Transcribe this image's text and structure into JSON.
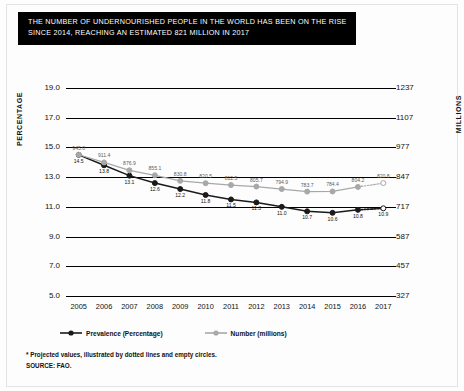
{
  "title": {
    "line1": "THE NUMBER OF UNDERNOURISHED PEOPLE IN THE WORLD HAS BEEN ON THE RISE",
    "line2": "SINCE 2014, REACHING AN ESTIMATED 821 MILLION IN 2017"
  },
  "axis_titles": {
    "left": "PERCENTAGE",
    "right": "MILLIONS"
  },
  "footnote": {
    "line1": "* Projected values, illustrated by dotted lines and empty circles.",
    "line2": "SOURCE: FAO."
  },
  "colors": {
    "prevalence": "#1a1a1a",
    "number": "#a8a8a8",
    "banner_bg": "#000000",
    "banner_text": "#ffffff",
    "grid": "#000000",
    "page_bg": "#fdfdfd"
  },
  "chart_data": {
    "type": "line",
    "title": "THE NUMBER OF UNDERNOURISHED PEOPLE IN THE WORLD HAS BEEN ON THE RISE SINCE 2014, REACHING AN ESTIMATED 821 MILLION IN 2017",
    "xlabel": "",
    "ylabel": "PERCENTAGE",
    "y2label": "MILLIONS",
    "grid": true,
    "legend_position": "bottom-left",
    "categories": [
      "2005",
      "2006",
      "2007",
      "2008",
      "2009",
      "2010",
      "2011",
      "2012",
      "2013",
      "2014",
      "2015",
      "2016",
      "2017"
    ],
    "xticklabels": [
      "2005",
      "2006",
      "2007",
      "2008",
      "2009",
      "2010",
      "2011",
      "2012",
      "2013",
      "2014",
      "2015",
      "2016",
      "2017"
    ],
    "ylim": [
      5.0,
      19.0
    ],
    "yticklabels": [
      "19.0",
      "17.0",
      "15.0",
      "13.0",
      "11.0",
      "9.0",
      "7.0",
      "5.0"
    ],
    "ytickvalues": [
      19.0,
      17.0,
      15.0,
      13.0,
      11.0,
      9.0,
      7.0,
      5.0
    ],
    "y2lim": [
      327,
      1237
    ],
    "y2ticklabels": [
      "1237",
      "1107",
      "977",
      "847",
      "717",
      "587",
      "457",
      "327"
    ],
    "y2tickvalues": [
      1237,
      1107,
      977,
      847,
      717,
      587,
      457,
      327
    ],
    "series": [
      {
        "name": "Prevalence (Percentage)",
        "axis": "left",
        "color": "#1a1a1a",
        "marker": "filled-circle",
        "values": [
          14.5,
          13.8,
          13.1,
          12.6,
          12.2,
          11.8,
          11.5,
          11.3,
          11.0,
          10.7,
          10.6,
          10.8,
          10.9
        ],
        "labels": [
          "14.5",
          "13.8",
          "13.1",
          "12.6",
          "12.2",
          "11.8",
          "11.5",
          "11.3",
          "11.0",
          "10.7",
          "10.6",
          "10.8",
          "10.9"
        ],
        "projected_from_index": 12,
        "projected_note": "2017 value is projected (dotted line, empty circle)"
      },
      {
        "name": "Number (millions)",
        "axis": "right",
        "color": "#a8a8a8",
        "marker": "filled-circle",
        "values": [
          945.0,
          911.4,
          876.9,
          855.1,
          830.8,
          820.5,
          812.5,
          805.7,
          794.9,
          783.7,
          784.4,
          804.2,
          820.8
        ],
        "labels": [
          "945.0",
          "911.4",
          "876.9",
          "855.1",
          "830.8",
          "820.5",
          "812.5",
          "805.7",
          "794.9",
          "783.7",
          "784.4",
          "804.2",
          "820.8"
        ],
        "projected_from_index": 12,
        "projected_note": "2017 value is projected (dotted line, empty circle)"
      }
    ],
    "legend": [
      {
        "label": "Prevalence (Percentage)",
        "color": "#1a1a1a",
        "marker": "filled-circle"
      },
      {
        "label": "Number (millions)",
        "color": "#a8a8a8",
        "marker": "filled-circle"
      }
    ]
  }
}
